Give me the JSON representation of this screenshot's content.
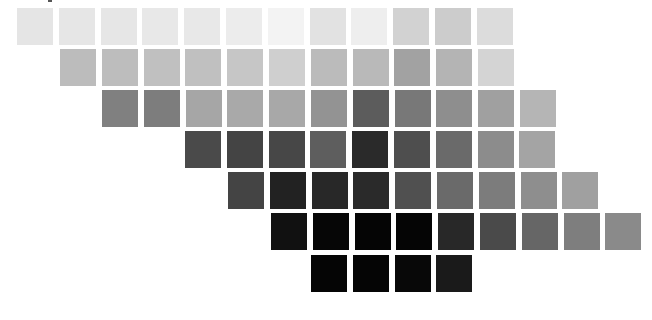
{
  "chart": {
    "swatch_width": 36,
    "swatch_height": 37,
    "pitch_x": 41.8
  },
  "rows": [
    {
      "x0": 17,
      "y": 8,
      "colors": [
        "#e5e5e5",
        "#e6e6e6",
        "#e6e6e6",
        "#e8e8e8",
        "#e8e8e8",
        "#ececec",
        "#f3f3f3",
        "#e2e2e2",
        "#eeeeee",
        "#d2d2d2",
        "#cccccc",
        "#dcdcdc"
      ]
    },
    {
      "x0": 60,
      "y": 49,
      "colors": [
        "#bcbcbc",
        "#bdbdbd",
        "#c0c0c0",
        "#c0c0c0",
        "#c6c6c6",
        "#cfcfcf",
        "#bbbbbb",
        "#b9b9b9",
        "#a2a2a2",
        "#b4b4b4",
        "#d4d4d4"
      ]
    },
    {
      "x0": 102,
      "y": 90,
      "colors": [
        "#808080",
        "#7d7d7d",
        "#a6a6a6",
        "#a9a9a9",
        "#a8a8a8",
        "#939393",
        "#5c5c5c",
        "#787878",
        "#8e8e8e",
        "#a0a0a0",
        "#b5b5b5"
      ]
    },
    {
      "x0": 185,
      "y": 131,
      "colors": [
        "#4a4a4a",
        "#444444",
        "#474747",
        "#5e5e5e",
        "#2a2a2a",
        "#4e4e4e",
        "#6a6a6a",
        "#8c8c8c",
        "#a4a4a4"
      ]
    },
    {
      "x0": 228,
      "y": 172,
      "colors": [
        "#444444",
        "#222222",
        "#282828",
        "#2a2a2a",
        "#505050",
        "#6a6a6a",
        "#7c7c7c",
        "#8e8e8e",
        "#a0a0a0"
      ]
    },
    {
      "x0": 271,
      "y": 213,
      "colors": [
        "#111111",
        "#060606",
        "#050505",
        "#050505",
        "#282828",
        "#4a4a4a",
        "#666666",
        "#7e7e7e",
        "#8a8a8a"
      ]
    },
    {
      "x0": 311,
      "y": 255,
      "colors": [
        "#050505",
        "#050505",
        "#080808",
        "#1a1a1a"
      ]
    }
  ]
}
